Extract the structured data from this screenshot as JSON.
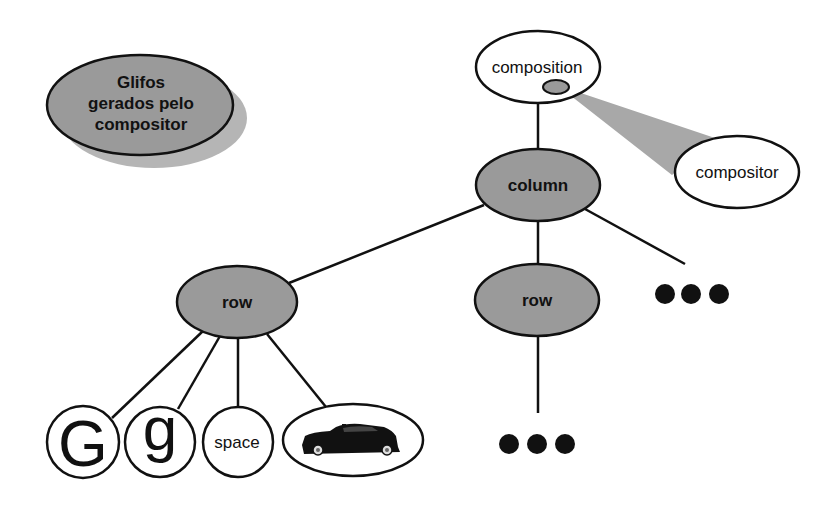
{
  "colors": {
    "background": "#ffffff",
    "shaded_node": "#9a9a9a",
    "shadow": "#b5b5b5",
    "cone": "#a8a8a8",
    "stroke": "#111111",
    "dot": "#111111"
  },
  "legend": {
    "line1": "Glifos",
    "line2": "gerados pelo",
    "line3": "compositor"
  },
  "nodes": {
    "composition": "composition",
    "compositor": "compositor",
    "column": "column",
    "row_left": "row",
    "row_middle": "row",
    "glyph_G": "G",
    "glyph_g": "g",
    "glyph_space": "space",
    "glyph_car": "car-image"
  },
  "ellipsis": {
    "right_of_column": "•••",
    "below_row_middle": "•••"
  }
}
